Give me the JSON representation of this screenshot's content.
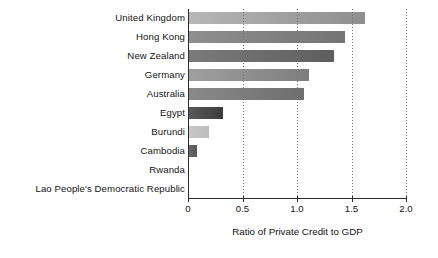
{
  "chart_data": {
    "type": "bar",
    "orientation": "horizontal",
    "title": "",
    "xlabel": "Ratio of Private Credit to GDP",
    "ylabel": "",
    "xlim": [
      0,
      2.0
    ],
    "xticks": [
      "0",
      "0.5",
      "1.0",
      "1.5",
      "2.0"
    ],
    "xtick_values": [
      0,
      0.5,
      1.0,
      1.5,
      2.0
    ],
    "grid": "vertical-dotted",
    "legend": "none",
    "categories": [
      "United Kingdom",
      "Hong Kong",
      "New Zealand",
      "Germany",
      "Australia",
      "Egypt",
      "Burundi",
      "Cambodia",
      "Rwanda",
      "Lao People's Democratic Republic"
    ],
    "values": [
      1.62,
      1.44,
      1.34,
      1.11,
      1.06,
      0.32,
      0.19,
      0.08,
      0.0,
      0.0
    ],
    "bar_colors": [
      "#b7b7b7",
      "#8f8f8f",
      "#7b7b7b",
      "#a0a0a0",
      "#8a8a8a",
      "#5a5a5a",
      "#c8c8c8",
      "#6a6a6a",
      "#9a9a9a",
      "#9a9a9a"
    ],
    "bar_colors_end": [
      "#8e8e8e",
      "#747474",
      "#5e5e5e",
      "#7e7e7e",
      "#6e6e6e",
      "#3c3c3c",
      "#bdbdbd",
      "#555555",
      "#9a9a9a",
      "#9a9a9a"
    ],
    "axis_color": "#2b2b2b",
    "grid_color": "#777777",
    "background_color": "#ffffff"
  }
}
